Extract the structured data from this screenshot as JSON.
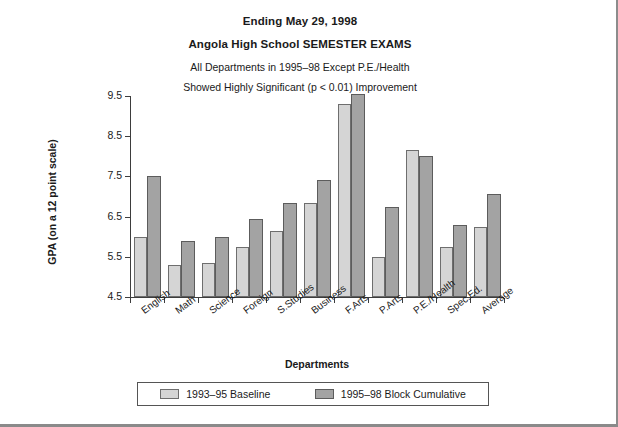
{
  "titles": {
    "line1": "Ending May 29, 1998",
    "line2": "Angola High School SEMESTER EXAMS",
    "line3": "All Departments in 1995–98 Except P.E./Health",
    "line4": "Showed Highly Significant (p < 0.01) Improvement"
  },
  "legend": {
    "series1_label": "1993–95 Baseline",
    "series2_label": "1995–98 Block Cumulative"
  },
  "colors": {
    "series1": "#d5d5d5",
    "series2": "#a3a3a3",
    "axis": "#3d3d3d",
    "page_border": "#8a8a8a"
  },
  "chart_data": {
    "type": "bar",
    "title": "Angola High School SEMESTER EXAMS",
    "subtitle": "Ending May 29, 1998",
    "annotation": "All Departments in 1995–98 Except P.E./Health Showed Highly Significant (p < 0.01) Improvement",
    "xlabel": "Departments",
    "ylabel": "GPA (on a 12 point scale)",
    "ylim": [
      4.5,
      9.5
    ],
    "yticks": [
      4.5,
      5.5,
      6.5,
      7.5,
      8.5,
      9.5
    ],
    "ytick_labels": [
      "4.5",
      "5.5",
      "6.5",
      "7.5",
      "8.5",
      "9.5"
    ],
    "grid": false,
    "legend_position": "bottom",
    "categories": [
      "English",
      "Math",
      "Science",
      "Foreign",
      "S.Studies",
      "Business",
      "F.Arts",
      "P.Arts",
      "P.E./Health",
      "Spec.Ed.",
      "Average"
    ],
    "series": [
      {
        "name": "1993–95 Baseline",
        "color": "#d5d5d5",
        "values": [
          6.0,
          5.3,
          5.35,
          5.75,
          6.15,
          6.85,
          9.3,
          5.5,
          8.15,
          5.75,
          6.25
        ]
      },
      {
        "name": "1995–98 Block Cumulative",
        "color": "#a3a3a3",
        "values": [
          7.5,
          5.9,
          6.0,
          6.45,
          6.85,
          7.4,
          9.55,
          6.75,
          8.0,
          6.3,
          7.05
        ]
      }
    ]
  }
}
